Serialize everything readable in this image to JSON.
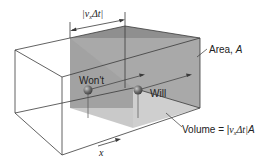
{
  "diagram": {
    "labels": {
      "width_bracket": "|vₓΔt|",
      "width_bracket_parts": {
        "open": "|",
        "v": "v",
        "sub": "x",
        "delta_t": "Δt",
        "close": "|"
      },
      "area_prefix": "Area, ",
      "area_symbol": "A",
      "wont": "Won't",
      "will": "Will",
      "volume_prefix": "Volume = |",
      "volume_v": "v",
      "volume_sub": "x",
      "volume_dt": "Δt|",
      "volume_A": "A",
      "axis_x": "x"
    },
    "colors": {
      "line": "#3a3a3a",
      "shade_top": "#9a9a9a",
      "shade_front": "#b9b9b9",
      "shade_side": "#a8a8a8",
      "shade_bottom": "#d4d4d4",
      "particle": "#6e6e6e"
    }
  }
}
